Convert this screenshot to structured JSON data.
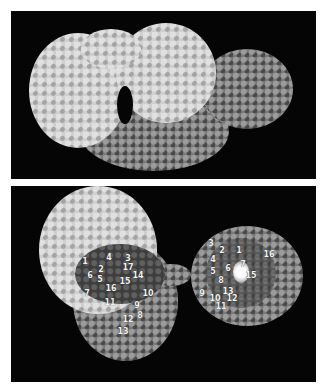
{
  "figure": {
    "panels": [
      {
        "id": "top",
        "description": "Space-filling molecular model, light-grey and mid-grey subunits",
        "labels": []
      },
      {
        "id": "bottom",
        "description": "Space-filling molecular models with numbered residues",
        "left_structure": {
          "labels": [
            {
              "text": "1",
              "x": 85,
              "y": 262
            },
            {
              "text": "4",
              "x": 109,
              "y": 258
            },
            {
              "text": "3",
              "x": 128,
              "y": 259
            },
            {
              "text": "2",
              "x": 101,
              "y": 270
            },
            {
              "text": "17",
              "x": 128,
              "y": 268
            },
            {
              "text": "6",
              "x": 90,
              "y": 276
            },
            {
              "text": "5",
              "x": 100,
              "y": 280
            },
            {
              "text": "14",
              "x": 138,
              "y": 276
            },
            {
              "text": "15",
              "x": 125,
              "y": 282
            },
            {
              "text": "16",
              "x": 111,
              "y": 289
            },
            {
              "text": "7",
              "x": 87,
              "y": 294
            },
            {
              "text": "10",
              "x": 148,
              "y": 294
            },
            {
              "text": "11",
              "x": 110,
              "y": 303
            },
            {
              "text": "9",
              "x": 137,
              "y": 306
            },
            {
              "text": "8",
              "x": 140,
              "y": 316
            },
            {
              "text": "12",
              "x": 128,
              "y": 320
            },
            {
              "text": "13",
              "x": 123,
              "y": 332
            }
          ]
        },
        "right_structure": {
          "labels": [
            {
              "text": "3",
              "x": 211,
              "y": 244
            },
            {
              "text": "2",
              "x": 222,
              "y": 251
            },
            {
              "text": "1",
              "x": 239,
              "y": 251
            },
            {
              "text": "16",
              "x": 269,
              "y": 255
            },
            {
              "text": "4",
              "x": 213,
              "y": 260
            },
            {
              "text": "7",
              "x": 243,
              "y": 265
            },
            {
              "text": "6",
              "x": 228,
              "y": 269
            },
            {
              "text": "5",
              "x": 213,
              "y": 272
            },
            {
              "text": "15",
              "x": 251,
              "y": 276
            },
            {
              "text": "8",
              "x": 221,
              "y": 281
            },
            {
              "text": "13",
              "x": 228,
              "y": 292
            },
            {
              "text": "9",
              "x": 202,
              "y": 294
            },
            {
              "text": "10",
              "x": 215,
              "y": 299
            },
            {
              "text": "12",
              "x": 232,
              "y": 299
            },
            {
              "text": "11",
              "x": 221,
              "y": 307
            }
          ]
        }
      }
    ],
    "colors": {
      "background": "#ffffff",
      "panel_background": "#050505",
      "light_subunit": "#cfcfcf",
      "mid_subunit": "#7a7a7a",
      "dark_residues": "#3e3e3e",
      "label_text": "#f2f2f2"
    }
  }
}
